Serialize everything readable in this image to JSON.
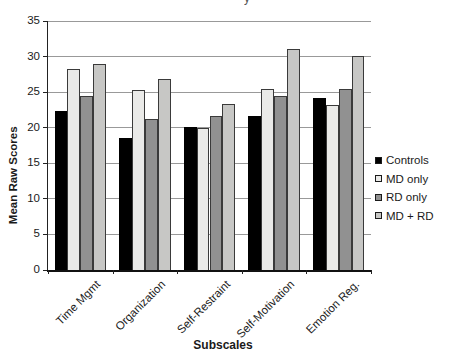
{
  "figure": {
    "cropped_title_fragment": "y"
  },
  "colors": {
    "background": "#ffffff",
    "gridline": "#999999",
    "axis": "#1a1a1a",
    "bar_outline": "#3a3a3a"
  },
  "chart_data": {
    "type": "bar",
    "title": "",
    "xlabel": "Subscales",
    "ylabel": "Mean Raw Scores",
    "categories": [
      "Time Mgmt",
      "Organization",
      "Self-Restraint",
      "Self-Motivation",
      "Emotion Reg."
    ],
    "series": [
      {
        "name": "Controls",
        "color": "#000000",
        "values": [
          22.4,
          18.5,
          20.1,
          21.6,
          24.2
        ]
      },
      {
        "name": "MD only",
        "color": "#eaeae8",
        "values": [
          28.3,
          25.3,
          20.0,
          25.4,
          23.2
        ]
      },
      {
        "name": "RD only",
        "color": "#919191",
        "values": [
          24.5,
          21.2,
          21.6,
          24.5,
          25.5
        ]
      },
      {
        "name": "MD + RD",
        "color": "#c7c7c5",
        "values": [
          28.9,
          26.9,
          23.4,
          31.1,
          30.1
        ]
      }
    ],
    "ylim": [
      0,
      35
    ],
    "ytick_step": 5,
    "yticks": [
      "0",
      "5",
      "10",
      "15",
      "20",
      "25",
      "30",
      "35"
    ],
    "grid": true,
    "legend_position": "right"
  }
}
